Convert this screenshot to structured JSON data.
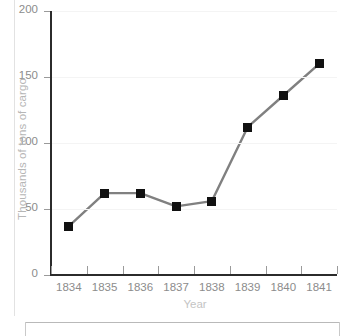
{
  "chart_data": {
    "type": "line",
    "title": "",
    "xlabel": "Year",
    "ylabel": "Thousands of tons of cargo",
    "categories": [
      "1834",
      "1835",
      "1836",
      "1837",
      "1838",
      "1839",
      "1840",
      "1841"
    ],
    "values": [
      37,
      62,
      62,
      52,
      56,
      112,
      136,
      160
    ],
    "series": [
      {
        "name": "Cargo",
        "values": [
          37,
          62,
          62,
          52,
          56,
          112,
          136,
          160
        ]
      }
    ],
    "ylim": [
      0,
      200
    ],
    "yticks": [
      "0",
      "50",
      "100",
      "150",
      "200"
    ],
    "ytick_values": [
      0,
      50,
      100,
      150,
      200
    ],
    "grid": "horizontal-faint",
    "legend": "none",
    "marker": "filled-square",
    "marker_color": "#111111",
    "line_color": "#808080",
    "axis_color": "#2b2b2b",
    "tick_label_color": "#8c8c8c",
    "axis_label_color": "#bdbdbd",
    "background": "#ffffff"
  }
}
